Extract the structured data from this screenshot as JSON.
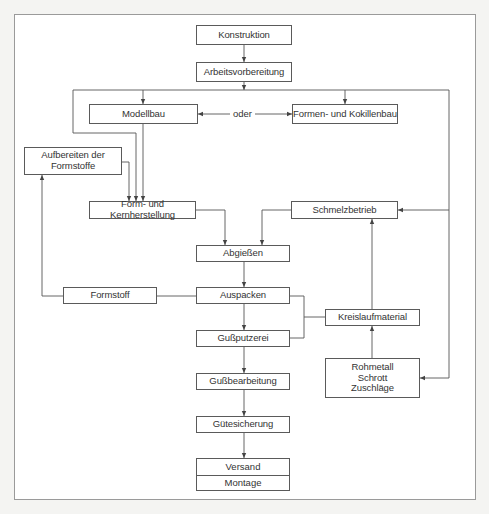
{
  "diagram": {
    "type": "flowchart",
    "title": "",
    "nodes": {
      "konstruktion": "Konstruktion",
      "arbeitsvorbereitung": "Arbeitsvorbereitung",
      "modellbau": "Modellbau",
      "oder": "oder",
      "formenbau": "Formen- und Kokillenbau",
      "aufbereiten": [
        "Aufbereiten der",
        "Formstoffe"
      ],
      "formherstellung": "Form- und Kernherstellung",
      "schmelzbetrieb": "Schmelzbetrieb",
      "abgiessen": "Abgießen",
      "formstoff": "Formstoff",
      "auspacken": "Auspacken",
      "kreislaufmaterial": "Kreislaufmaterial",
      "gussputzerei": "Gußputzerei",
      "rohmetall": [
        "Rohmetall",
        "Schrott",
        "Zuschläge"
      ],
      "gussbearbeitung": "Gußbearbeitung",
      "guetesicherung": "Gütesicherung",
      "versand": "Versand",
      "montage": "Montage"
    },
    "edges": [
      {
        "from": "Konstruktion",
        "to": "Arbeitsvorbereitung"
      },
      {
        "from": "Arbeitsvorbereitung",
        "to": "Modellbau"
      },
      {
        "from": "Arbeitsvorbereitung",
        "to": "Formen- und Kokillenbau"
      },
      {
        "from": "Arbeitsvorbereitung",
        "to": "Form- und Kernherstellung"
      },
      {
        "from": "Arbeitsvorbereitung",
        "to": "Schmelzbetrieb"
      },
      {
        "from": "Arbeitsvorbereitung",
        "to": "Rohmetall/Schrott/Zuschläge"
      },
      {
        "from": "Modellbau",
        "to": "Formen- und Kokillenbau",
        "label": "oder",
        "bidirectional": true
      },
      {
        "from": "Modellbau",
        "to": "Form- und Kernherstellung"
      },
      {
        "from": "Aufbereiten der Formstoffe",
        "to": "Form- und Kernherstellung"
      },
      {
        "from": "Form- und Kernherstellung",
        "to": "Abgießen"
      },
      {
        "from": "Schmelzbetrieb",
        "to": "Abgießen"
      },
      {
        "from": "Abgießen",
        "to": "Auspacken"
      },
      {
        "from": "Auspacken",
        "to": "Formstoff"
      },
      {
        "from": "Formstoff",
        "to": "Aufbereiten der Formstoffe"
      },
      {
        "from": "Auspacken",
        "to": "Gußputzerei"
      },
      {
        "from": "Auspacken",
        "to": "Kreislaufmaterial"
      },
      {
        "from": "Gußputzerei",
        "to": "Kreislaufmaterial"
      },
      {
        "from": "Rohmetall/Schrott/Zuschläge",
        "to": "Kreislaufmaterial"
      },
      {
        "from": "Kreislaufmaterial",
        "to": "Schmelzbetrieb"
      },
      {
        "from": "Gußputzerei",
        "to": "Gußbearbeitung"
      },
      {
        "from": "Gußbearbeitung",
        "to": "Gütesicherung"
      },
      {
        "from": "Gütesicherung",
        "to": "Versand/Montage"
      }
    ]
  }
}
